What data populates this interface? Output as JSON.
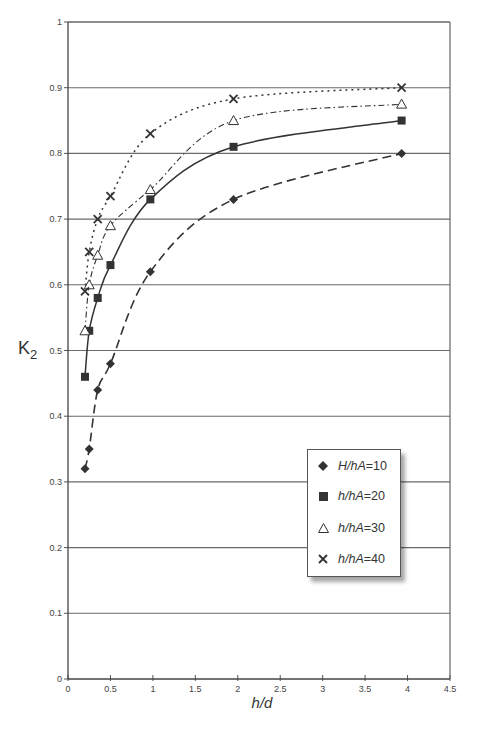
{
  "chart_data": {
    "type": "scatter",
    "title": "",
    "xlabel": "h/d",
    "ylabel": "K2",
    "xlim": [
      0,
      4.5
    ],
    "ylim": [
      0,
      1
    ],
    "xticks": [
      "0",
      "0.5",
      "1",
      "1.5",
      "2",
      "2.5",
      "3",
      "3.5",
      "4",
      "4.5"
    ],
    "yticks": [
      "0",
      "0.1",
      "0.2",
      "0.3",
      "0.4",
      "0.5",
      "0.6",
      "0.7",
      "0.8",
      "0.9",
      "1"
    ],
    "grid": "horizontal",
    "legend_position": "lower-right inside plot",
    "series": [
      {
        "name": "H/hA=10",
        "marker": "diamond",
        "line": "long-dash fitted curve",
        "x": [
          0.2,
          0.25,
          0.35,
          0.5,
          0.97,
          1.95,
          3.93
        ],
        "y": [
          0.32,
          0.35,
          0.44,
          0.48,
          0.62,
          0.73,
          0.8
        ]
      },
      {
        "name": "h/hA=20",
        "marker": "filled-square",
        "line": "solid fitted curve",
        "x": [
          0.2,
          0.25,
          0.35,
          0.5,
          0.97,
          1.95,
          3.93
        ],
        "y": [
          0.46,
          0.53,
          0.58,
          0.63,
          0.73,
          0.81,
          0.85
        ]
      },
      {
        "name": "h/hA=30",
        "marker": "open-triangle",
        "line": "dash-dot fitted curve",
        "x": [
          0.2,
          0.25,
          0.35,
          0.5,
          0.97,
          1.95,
          3.93
        ],
        "y": [
          0.53,
          0.6,
          0.645,
          0.69,
          0.745,
          0.85,
          0.875
        ]
      },
      {
        "name": "h/hA=40",
        "marker": "x-cross",
        "line": "dotted fitted curve",
        "x": [
          0.2,
          0.25,
          0.35,
          0.5,
          0.97,
          1.95,
          3.93
        ],
        "y": [
          0.59,
          0.65,
          0.7,
          0.735,
          0.83,
          0.883,
          0.9
        ]
      }
    ]
  },
  "axes": {
    "x_title": "h/d",
    "y_title_main": "K",
    "y_title_sub": "2"
  },
  "legend": {
    "items": [
      {
        "var": "H/hA",
        "value": "=10",
        "marker": "diamond-icon"
      },
      {
        "var": "h/hA",
        "value": "=20",
        "marker": "square-icon"
      },
      {
        "var": "h/hA",
        "value": "=30",
        "marker": "triangle-icon"
      },
      {
        "var": "h/hA",
        "value": "=40",
        "marker": "x-cross-icon"
      }
    ]
  },
  "colors": {
    "ink": "#333333",
    "grid": "#666666",
    "axis": "#555555"
  }
}
